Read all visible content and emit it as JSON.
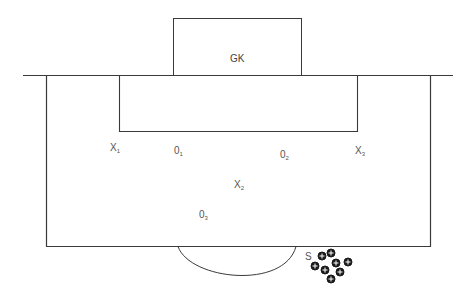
{
  "diagram": {
    "goal_label": "GK",
    "players": [
      {
        "id": "x1",
        "base": "X",
        "sub": "1",
        "x": 110,
        "y": 144
      },
      {
        "id": "o1",
        "base": "0",
        "sub": "1",
        "x": 174,
        "y": 147
      },
      {
        "id": "o2",
        "base": "0",
        "sub": "2",
        "x": 279,
        "y": 151
      },
      {
        "id": "x3",
        "base": "X",
        "sub": "3",
        "x": 355,
        "y": 147
      },
      {
        "id": "x2",
        "base": "X",
        "sub": "2",
        "x": 234,
        "y": 180
      },
      {
        "id": "o3",
        "base": "0",
        "sub": "3",
        "x": 199,
        "y": 210
      }
    ],
    "server_label": "S",
    "ball_count": 8,
    "colors": {
      "line": "#3a3a3a",
      "text": "#555555",
      "background": "#ffffff"
    }
  }
}
